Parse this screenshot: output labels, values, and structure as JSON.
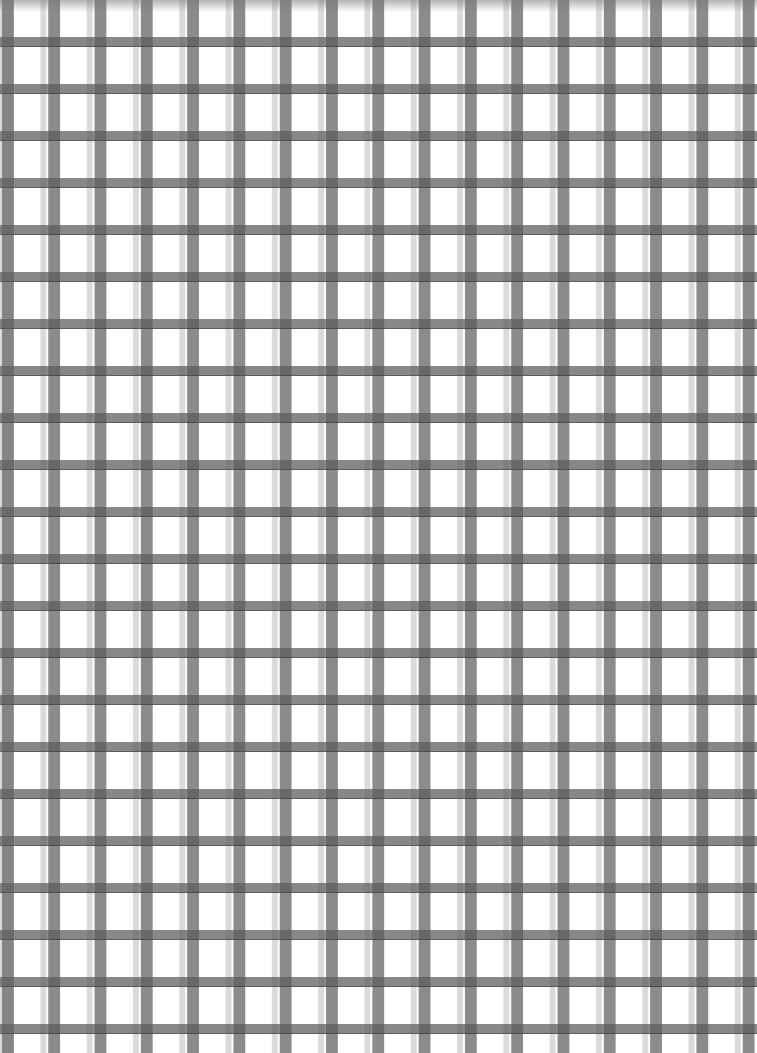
{
  "image": {
    "description": "Watercolor-painted gray gingham / plaid grid texture",
    "pattern": {
      "type": "plaid-grid",
      "period_px": {
        "x": 46.3,
        "y": 47
      },
      "vertical_dark_stripe_width_px": 12,
      "vertical_light_stripe_width_px": 8,
      "horizontal_dark_band_height_px": 11,
      "horizontal_light_band_height_px": 12
    },
    "colors": {
      "background": "#ffffff",
      "dark_band": "#7a7a7a",
      "light_band": "#c8c8c8",
      "intersection": "#5a5a5a",
      "fine_line": "#3a3a3a"
    }
  }
}
